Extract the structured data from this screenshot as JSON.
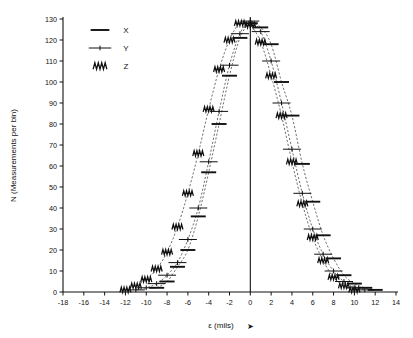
{
  "chart_data": {
    "type": "scatter",
    "title": "",
    "xlabel": "ε (mils)",
    "xlabel_arrow": "➤",
    "ylabel": "N (Measurements per bin)",
    "xlim": [
      -18,
      14
    ],
    "ylim": [
      0,
      130
    ],
    "xticks": [
      -18,
      -16,
      -14,
      -12,
      -10,
      -8,
      -6,
      -4,
      -2,
      0,
      2,
      4,
      6,
      8,
      10,
      12,
      14
    ],
    "yticks": [
      0,
      10,
      20,
      30,
      40,
      50,
      60,
      70,
      80,
      90,
      100,
      110,
      120,
      130
    ],
    "xtick_labels": [
      "-18",
      "-16",
      "-14",
      "-12",
      "-10",
      "-8",
      "-6",
      "-4",
      "-2",
      "0",
      "2",
      "4",
      "6",
      "8",
      "10",
      "12",
      "14"
    ],
    "ytick_labels": [
      "0",
      "10",
      "20",
      "30",
      "40",
      "50",
      "60",
      "70",
      "80",
      "90",
      "100",
      "110",
      "120",
      "130"
    ],
    "grid": false,
    "legend_position": "top-left",
    "zero_line": 0,
    "series": [
      {
        "name": "X",
        "marker": "horizontal-dash",
        "fit": "gaussian",
        "points": [
          {
            "x": -9,
            "y": 2
          },
          {
            "x": -8,
            "y": 5
          },
          {
            "x": -7,
            "y": 12
          },
          {
            "x": -6,
            "y": 20
          },
          {
            "x": -5,
            "y": 36
          },
          {
            "x": -4,
            "y": 57
          },
          {
            "x": -3,
            "y": 80
          },
          {
            "x": -2,
            "y": 103
          },
          {
            "x": -1,
            "y": 121
          },
          {
            "x": 0,
            "y": 128
          },
          {
            "x": 1,
            "y": 126
          },
          {
            "x": 2,
            "y": 118
          },
          {
            "x": 3,
            "y": 100
          },
          {
            "x": 4,
            "y": 84
          },
          {
            "x": 5,
            "y": 61
          },
          {
            "x": 6,
            "y": 43
          },
          {
            "x": 7,
            "y": 27
          },
          {
            "x": 8,
            "y": 16
          },
          {
            "x": 9,
            "y": 8
          },
          {
            "x": 10,
            "y": 4
          },
          {
            "x": 11,
            "y": 2
          },
          {
            "x": 12,
            "y": 1
          }
        ]
      },
      {
        "name": "Y",
        "marker": "line-with-tick",
        "fit": "gaussian",
        "points": [
          {
            "x": -11,
            "y": 1
          },
          {
            "x": -10,
            "y": 2
          },
          {
            "x": -9,
            "y": 4
          },
          {
            "x": -8,
            "y": 8
          },
          {
            "x": -7,
            "y": 14
          },
          {
            "x": -6,
            "y": 25
          },
          {
            "x": -5,
            "y": 40
          },
          {
            "x": -4,
            "y": 62
          },
          {
            "x": -3,
            "y": 86
          },
          {
            "x": -2,
            "y": 108
          },
          {
            "x": -1,
            "y": 123
          },
          {
            "x": 0,
            "y": 129
          },
          {
            "x": 1,
            "y": 124
          },
          {
            "x": 2,
            "y": 110
          },
          {
            "x": 3,
            "y": 90
          },
          {
            "x": 4,
            "y": 68
          },
          {
            "x": 5,
            "y": 47
          },
          {
            "x": 6,
            "y": 30
          },
          {
            "x": 7,
            "y": 18
          },
          {
            "x": 8,
            "y": 10
          },
          {
            "x": 9,
            "y": 5
          },
          {
            "x": 10,
            "y": 2
          },
          {
            "x": 11,
            "y": 1
          }
        ]
      },
      {
        "name": "Z",
        "marker": "zigzag",
        "fit": "gaussian",
        "points": [
          {
            "x": -12,
            "y": 1
          },
          {
            "x": -11,
            "y": 3
          },
          {
            "x": -10,
            "y": 6
          },
          {
            "x": -9,
            "y": 11
          },
          {
            "x": -8,
            "y": 19
          },
          {
            "x": -7,
            "y": 31
          },
          {
            "x": -6,
            "y": 47
          },
          {
            "x": -5,
            "y": 66
          },
          {
            "x": -4,
            "y": 87
          },
          {
            "x": -3,
            "y": 106
          },
          {
            "x": -2,
            "y": 120
          },
          {
            "x": -1,
            "y": 128
          },
          {
            "x": 0,
            "y": 127
          },
          {
            "x": 1,
            "y": 119
          },
          {
            "x": 2,
            "y": 103
          },
          {
            "x": 3,
            "y": 84
          },
          {
            "x": 4,
            "y": 62
          },
          {
            "x": 5,
            "y": 42
          },
          {
            "x": 6,
            "y": 26
          },
          {
            "x": 7,
            "y": 15
          },
          {
            "x": 8,
            "y": 7
          },
          {
            "x": 9,
            "y": 3
          },
          {
            "x": 10,
            "y": 1
          }
        ]
      }
    ],
    "legend": [
      {
        "label": "X",
        "marker": "horizontal-dash"
      },
      {
        "label": "Y",
        "marker": "line-with-tick"
      },
      {
        "label": "Z",
        "marker": "zigzag"
      }
    ]
  }
}
